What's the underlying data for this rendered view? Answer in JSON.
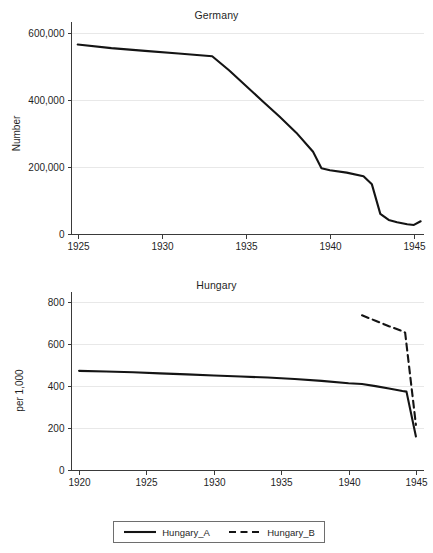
{
  "figure": {
    "width": 433,
    "height": 553,
    "background": "#ffffff",
    "line_color": "#141414",
    "grid_color": "#e8e8e8",
    "axis_color": "#3a3a3a"
  },
  "panels": {
    "germany": {
      "title": "Germany",
      "ylabel": "Number",
      "yticks": [
        "0",
        "200,000",
        "400,000",
        "600,000"
      ],
      "xticks": [
        "1925",
        "1930",
        "1935",
        "1940",
        "1945"
      ]
    },
    "hungary": {
      "title": "Hungary",
      "ylabel": "per 1,000",
      "yticks": [
        "0",
        "200",
        "400",
        "600",
        "800"
      ],
      "xticks": [
        "1920",
        "1925",
        "1930",
        "1935",
        "1940",
        "1945"
      ]
    }
  },
  "legend": {
    "entries": [
      {
        "label": "Hungary_A",
        "style": "solid",
        "swatch": "solid-line-swatch"
      },
      {
        "label": "Hungary_B",
        "style": "dashed",
        "swatch": "dashed-line-swatch"
      }
    ]
  },
  "chart_data": [
    {
      "type": "line",
      "id": "germany",
      "title": "Germany",
      "xlabel": "",
      "ylabel": "Number",
      "xlim": [
        1924.6,
        1945.6
      ],
      "ylim": [
        0,
        620000
      ],
      "yticks": [
        0,
        200000,
        400000,
        600000
      ],
      "ytick_labels": [
        "0",
        "200,000",
        "400,000",
        "600,000"
      ],
      "xticks": [
        1925,
        1930,
        1935,
        1940,
        1945
      ],
      "xtick_labels": [
        "1925",
        "1930",
        "1935",
        "1940",
        "1945"
      ],
      "grid": true,
      "grid_axis": "y",
      "legend": false,
      "series": [
        {
          "name": "Germany",
          "style": "solid",
          "x": [
            1925,
            1927,
            1929,
            1931,
            1933,
            1934,
            1935,
            1936,
            1937,
            1938,
            1939,
            1939.5,
            1940,
            1941,
            1942,
            1942.5,
            1943,
            1943.5,
            1944,
            1944.6,
            1945,
            1945.4
          ],
          "y": [
            565000,
            554000,
            546000,
            538000,
            530000,
            488000,
            442000,
            396000,
            350000,
            302000,
            245000,
            196000,
            190000,
            183000,
            172000,
            148000,
            60000,
            42000,
            35000,
            29000,
            27000,
            38000
          ]
        }
      ]
    },
    {
      "type": "line",
      "id": "hungary",
      "title": "Hungary",
      "xlabel": "",
      "ylabel": "per 1,000",
      "xlim": [
        1919.4,
        1945.6
      ],
      "ylim": [
        0,
        830
      ],
      "yticks": [
        0,
        200,
        400,
        600,
        800
      ],
      "ytick_labels": [
        "0",
        "200",
        "400",
        "600",
        "800"
      ],
      "xticks": [
        1920,
        1925,
        1930,
        1935,
        1940,
        1945
      ],
      "xtick_labels": [
        "1920",
        "1925",
        "1930",
        "1935",
        "1940",
        "1945"
      ],
      "grid": true,
      "grid_axis": "y",
      "legend": true,
      "legend_position": "below",
      "series": [
        {
          "name": "Hungary_A",
          "style": "solid",
          "x": [
            1920,
            1922,
            1924,
            1926,
            1928,
            1930,
            1932,
            1934,
            1936,
            1938,
            1940,
            1941,
            1942,
            1943,
            1944,
            1944.3,
            1945
          ],
          "y": [
            473,
            470,
            466,
            461,
            456,
            451,
            446,
            441,
            434,
            425,
            414,
            410,
            400,
            389,
            377,
            374,
            160
          ]
        },
        {
          "name": "Hungary_B",
          "style": "dashed",
          "x": [
            1941,
            1942,
            1943,
            1944,
            1944.2,
            1945
          ],
          "y": [
            738,
            712,
            686,
            662,
            655,
            215
          ]
        }
      ]
    }
  ]
}
